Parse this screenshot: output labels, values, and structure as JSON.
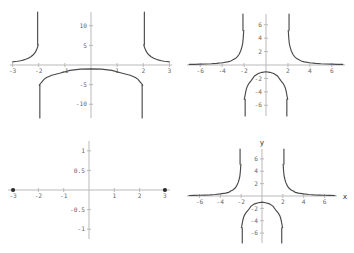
{
  "figure": {
    "background": "#ffffff",
    "curve_color": "#4a4a4a",
    "axis_color": "#b9b9b9",
    "label_color": "#676767",
    "panel_count": 4
  },
  "chart_data": [
    {
      "id": "top-left",
      "type": "line",
      "title": "",
      "xlabel": "",
      "ylabel": "",
      "xlim": [
        -3.1,
        3.1
      ],
      "ylim": [
        -13.5,
        13.5
      ],
      "grid": false,
      "legend": null,
      "xticks": [
        -3,
        -2,
        -1,
        1,
        2,
        3
      ],
      "xticklabels": [
        "-3",
        "-2",
        "-1",
        "1",
        "2",
        "3"
      ],
      "yticks": [
        10,
        5,
        -5,
        -10
      ],
      "yticklabels": [
        "10",
        "5",
        "-5",
        "-10"
      ],
      "asymptotes_x": [
        -2,
        2
      ],
      "series": [
        {
          "name": "y = 4/(x^2-4)",
          "branches": [
            {
              "name": "left-branch",
              "x": [
                -3.0,
                -2.9,
                -2.8,
                -2.7,
                -2.6,
                -2.5,
                -2.4,
                -2.3,
                -2.2,
                -2.15,
                -2.1,
                -2.07,
                -2.05,
                -2.03,
                -2.02
              ],
              "y": [
                0.8,
                0.883,
                0.96,
                1.086,
                1.25,
                1.455,
                1.73,
                2.12,
                2.67,
                3.07,
                3.66,
                4.12,
                4.46,
                4.89,
                5.13
              ]
            },
            {
              "name": "middle-branch",
              "x": [
                -1.98,
                -1.95,
                -1.9,
                -1.8,
                -1.7,
                -1.5,
                -1.2,
                -0.8,
                -0.4,
                0,
                0.4,
                0.8,
                1.2,
                1.5,
                1.7,
                1.8,
                1.9,
                1.95,
                1.98
              ],
              "y": [
                -5.13,
                -4.89,
                -4.46,
                -3.66,
                -3.17,
                -2.62,
                -2.1,
                -1.36,
                -1.05,
                -1.0,
                -1.05,
                -1.36,
                -2.1,
                -2.62,
                -3.17,
                -3.66,
                -4.46,
                -4.89,
                -5.13
              ]
            },
            {
              "name": "right-branch",
              "x": [
                2.02,
                2.03,
                2.05,
                2.07,
                2.1,
                2.15,
                2.2,
                2.3,
                2.4,
                2.5,
                2.6,
                2.7,
                2.8,
                2.9,
                3.0
              ],
              "y": [
                5.13,
                4.89,
                4.46,
                4.12,
                3.66,
                3.07,
                2.67,
                2.12,
                1.73,
                1.455,
                1.25,
                1.086,
                0.96,
                0.883,
                0.8
              ]
            }
          ]
        }
      ]
    },
    {
      "id": "top-right",
      "type": "line",
      "title": "",
      "xlabel": "",
      "ylabel": "",
      "xlim": [
        -7.2,
        7.2
      ],
      "ylim": [
        -7.6,
        7.6
      ],
      "grid": false,
      "legend": null,
      "xticks": [
        -6,
        -4,
        -2,
        2,
        4,
        6
      ],
      "xticklabels": [
        "-6",
        "-4",
        "-2",
        "2",
        "4",
        "6"
      ],
      "yticks": [
        6,
        4,
        2,
        -2,
        -4,
        -6
      ],
      "yticklabels": [
        "6",
        "4",
        "2",
        "-2",
        "-4",
        "-6"
      ],
      "asymptotes_x": [
        -2,
        2
      ],
      "series": [
        {
          "name": "y = 4/(x^2-4)",
          "branches": [
            {
              "name": "left-branch",
              "x": [
                -7.0,
                -6.5,
                -6.0,
                -5.5,
                -5.0,
                -4.5,
                -4.0,
                -3.5,
                -3.2,
                -3.0,
                -2.8,
                -2.6,
                -2.45,
                -2.3,
                -2.2,
                -2.12,
                -2.07,
                -2.04,
                -2.02
              ],
              "y": [
                0.089,
                0.103,
                0.125,
                0.152,
                0.19,
                0.25,
                0.333,
                0.471,
                0.588,
                0.8,
                0.96,
                1.25,
                1.6,
                2.12,
                2.67,
                3.24,
                4.12,
                4.96,
                5.13
              ]
            },
            {
              "name": "middle-branch",
              "x": [
                -1.98,
                -1.96,
                -1.93,
                -1.9,
                -1.85,
                -1.78,
                -1.7,
                -1.55,
                -1.35,
                -1.05,
                -0.7,
                -0.35,
                0,
                0.35,
                0.7,
                1.05,
                1.35,
                1.55,
                1.7,
                1.78,
                1.85,
                1.9,
                1.93,
                1.96,
                1.98
              ],
              "y": [
                -5.13,
                -5.0,
                -4.7,
                -4.46,
                -4.0,
                -3.52,
                -3.17,
                -2.72,
                -2.34,
                -1.63,
                -1.27,
                -1.09,
                -1.0,
                -1.09,
                -1.27,
                -1.63,
                -2.34,
                -2.72,
                -3.17,
                -3.52,
                -4.0,
                -4.46,
                -4.7,
                -5.0,
                -5.13
              ]
            },
            {
              "name": "right-branch",
              "x": [
                2.02,
                2.04,
                2.07,
                2.12,
                2.2,
                2.3,
                2.45,
                2.6,
                2.8,
                3.0,
                3.2,
                3.5,
                4.0,
                4.5,
                5.0,
                5.5,
                6.0,
                6.5,
                7.0
              ],
              "y": [
                5.13,
                4.96,
                4.12,
                3.24,
                2.67,
                2.12,
                1.6,
                1.25,
                0.96,
                0.8,
                0.588,
                0.471,
                0.333,
                0.25,
                0.19,
                0.152,
                0.125,
                0.103,
                0.089
              ]
            }
          ]
        }
      ]
    },
    {
      "id": "bottom-left",
      "type": "line",
      "title": "",
      "xlabel": "",
      "ylabel": "",
      "xlim": [
        -3.2,
        3.2
      ],
      "ylim": [
        -1.25,
        1.25
      ],
      "grid": false,
      "legend": null,
      "xticks": [
        -3,
        -2,
        -1,
        1,
        2,
        3
      ],
      "xticklabels": [
        "-3",
        "-2",
        "-1",
        "1",
        "2",
        "3"
      ],
      "yticks": [
        1,
        0.5,
        -0.5,
        -1
      ],
      "yticklabels": [
        "1",
        "0.5",
        "-0.5",
        "-1"
      ],
      "endpoints": [
        {
          "name": "left-endpoint",
          "x": -3,
          "y": 0
        },
        {
          "name": "right-endpoint",
          "x": 3,
          "y": 0
        }
      ],
      "series": []
    },
    {
      "id": "bottom-right",
      "type": "line",
      "title": "",
      "xlabel": "x",
      "ylabel": "y",
      "xlim": [
        -7.2,
        7.2
      ],
      "ylim": [
        -7.6,
        7.6
      ],
      "grid": false,
      "legend": null,
      "xticks": [
        -6,
        -4,
        -2,
        2,
        4,
        6
      ],
      "xticklabels": [
        "-6",
        "-4",
        "-2",
        "2",
        "4",
        "6"
      ],
      "yticks": [
        6,
        4,
        2,
        -2,
        -4,
        -6
      ],
      "yticklabels": [
        "6",
        "4",
        "2",
        "-2",
        "-4",
        "-6"
      ],
      "asymptotes_x": [
        -2,
        2
      ],
      "series": [
        {
          "name": "y = 4/(x^2-4)",
          "branches": [
            {
              "name": "left-branch",
              "x": [
                -7.0,
                -6.5,
                -6.0,
                -5.5,
                -5.0,
                -4.5,
                -4.0,
                -3.5,
                -3.2,
                -3.0,
                -2.8,
                -2.6,
                -2.45,
                -2.3,
                -2.2,
                -2.12,
                -2.07,
                -2.04,
                -2.02
              ],
              "y": [
                0.089,
                0.103,
                0.125,
                0.152,
                0.19,
                0.25,
                0.333,
                0.471,
                0.588,
                0.8,
                0.96,
                1.25,
                1.6,
                2.12,
                2.67,
                3.24,
                4.12,
                4.96,
                5.13
              ]
            },
            {
              "name": "middle-branch",
              "x": [
                -1.98,
                -1.96,
                -1.93,
                -1.9,
                -1.85,
                -1.78,
                -1.7,
                -1.55,
                -1.35,
                -1.05,
                -0.7,
                -0.35,
                0,
                0.35,
                0.7,
                1.05,
                1.35,
                1.55,
                1.7,
                1.78,
                1.85,
                1.9,
                1.93,
                1.96,
                1.98
              ],
              "y": [
                -5.13,
                -5.0,
                -4.7,
                -4.46,
                -4.0,
                -3.52,
                -3.17,
                -2.72,
                -2.34,
                -1.63,
                -1.27,
                -1.09,
                -1.0,
                -1.09,
                -1.27,
                -1.63,
                -2.34,
                -2.72,
                -3.17,
                -3.52,
                -4.0,
                -4.46,
                -4.7,
                -5.0,
                -5.13
              ]
            },
            {
              "name": "right-branch",
              "x": [
                2.02,
                2.04,
                2.07,
                2.12,
                2.2,
                2.3,
                2.45,
                2.6,
                2.8,
                3.0,
                3.2,
                3.5,
                4.0,
                4.5,
                5.0,
                5.5,
                6.0,
                6.5,
                7.0
              ],
              "y": [
                5.13,
                4.96,
                4.12,
                3.24,
                2.67,
                2.12,
                1.6,
                1.25,
                0.96,
                0.8,
                0.588,
                0.471,
                0.333,
                0.25,
                0.19,
                0.152,
                0.125,
                0.103,
                0.089
              ]
            }
          ]
        }
      ]
    }
  ]
}
